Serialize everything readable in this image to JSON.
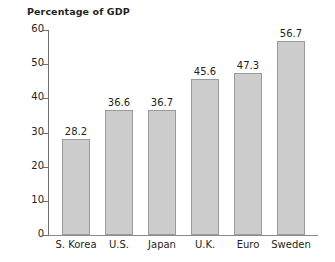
{
  "chart_data": {
    "type": "bar",
    "title": "Percentage of GDP",
    "subtitle": "",
    "xlabel": "",
    "ylabel": "",
    "categories": [
      "S. Korea",
      "U.S.",
      "Japan",
      "U.K.",
      "Euro",
      "Sweden"
    ],
    "values": [
      28.2,
      36.6,
      36.7,
      45.6,
      47.3,
      56.7
    ],
    "value_labels": [
      "28.2",
      "36.6",
      "36.7",
      "45.6",
      "47.3",
      "56.7"
    ],
    "ylim": [
      0,
      60
    ],
    "yticks": [
      0,
      10,
      20,
      30,
      40,
      50,
      60
    ],
    "ytick_labels": [
      "0",
      "10",
      "20",
      "30",
      "40",
      "50",
      "60"
    ],
    "grid": false,
    "legend": null,
    "bar_fill_color": "#cccccc",
    "bar_border_color": "#9a9a9a",
    "axis_color": "#6f6f6f",
    "text_color": "#231f20",
    "background_color": "#ffffff"
  }
}
